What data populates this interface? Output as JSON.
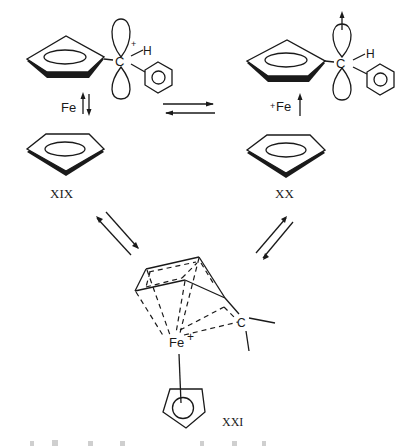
{
  "figure": {
    "type": "reaction-scheme",
    "ink_color": "#1a1a1a",
    "background_color": "#ffffff"
  },
  "structures": {
    "xix": {
      "label": "XIX",
      "carbon_label": "C",
      "charge_on_carbon": "+",
      "hydrogen_label": "H",
      "iron_label": "Fe",
      "iron_arrows": "up-down equilibrium"
    },
    "xx": {
      "label": "XX",
      "carbon_label": "C",
      "hydrogen_label": "H",
      "iron_label": "Fe",
      "iron_charge": "+",
      "iron_arrows": "up arrow"
    },
    "xxi": {
      "label": "XXI",
      "iron_label": "Fe",
      "iron_charge": "+",
      "carbon_label": "C"
    }
  },
  "equilibria": [
    {
      "from": "XIX",
      "to": "XX",
      "direction": "horizontal"
    },
    {
      "from": "XIX",
      "to": "XXI",
      "direction": "diagonal"
    },
    {
      "from": "XX",
      "to": "XXI",
      "direction": "diagonal"
    }
  ]
}
